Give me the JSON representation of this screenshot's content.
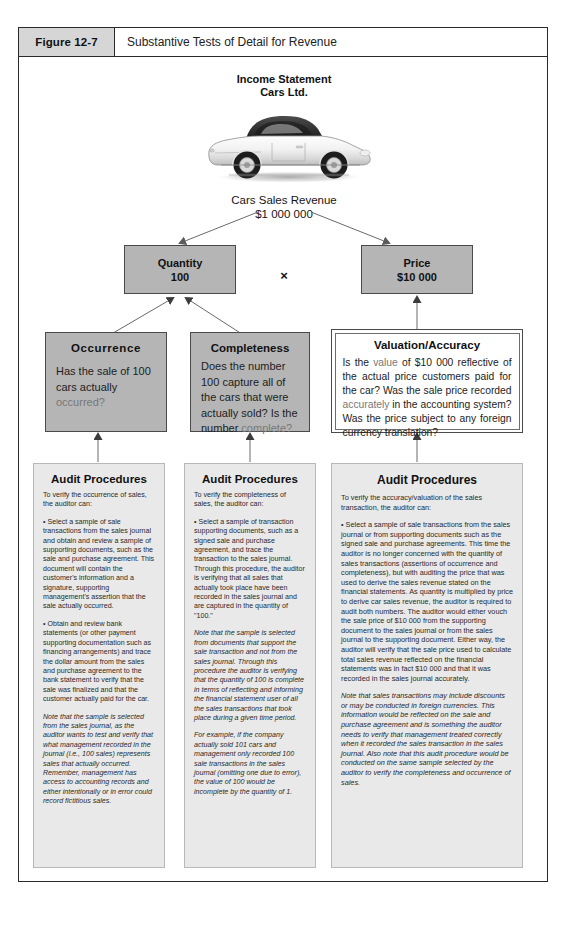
{
  "figure": {
    "number": "Figure 12-7",
    "title": "Substantive Tests of Detail for Revenue"
  },
  "statement": {
    "line1": "Income Statement",
    "line2": "Cars Ltd."
  },
  "image": {
    "alt": "white-sports-car-side-view"
  },
  "revenue": {
    "label": "Cars Sales Revenue",
    "amount": "$1 000 000"
  },
  "factors": {
    "quantity": {
      "label": "Quantity",
      "value": "100"
    },
    "operator": "×",
    "price": {
      "label": "Price",
      "value": "$10 000"
    }
  },
  "assertions": [
    {
      "id": "occurrence",
      "title": "Occurrence",
      "body_pre": "Has the sale of 100 cars actually ",
      "body_highlight": "occurred?",
      "body_post": ""
    },
    {
      "id": "completeness",
      "title": "Completeness",
      "body_pre": "Does the number 100 capture all of the cars that were actually sold? Is the number ",
      "body_highlight": "complete?",
      "body_post": ""
    },
    {
      "id": "valuation-accuracy",
      "title": "Valuation/Accuracy",
      "body_pre": "Is the ",
      "body_highlight": "value",
      "body_mid": " of $10 000 reflective of the actual price customers paid for the car? Was the sale price recorded ",
      "body_highlight2": "accurately",
      "body_post": " in the accounting system? Was the price subject to any foreign currency translation?"
    }
  ],
  "procedures": [
    {
      "id": "occurrence-procedures",
      "title": "Audit Procedures",
      "paragraphs": [
        {
          "text": "To verify the occurrence of sales, the auditor can:",
          "italic": false
        },
        {
          "text": "• Select a sample of sale transactions from the sales journal and obtain and review a sample of supporting documents, such as the sale and purchase agreement. This document will contain the customer's information and a signature, supporting management's assertion that the sale actually occurred.",
          "italic": false
        },
        {
          "text": "• Obtain and review bank statements (or other payment supporting documentation such as financing arrangements) and trace the dollar amount from the sales and purchase agreement to the bank statement to verify that the sale was finalized and that the customer actually paid for the car.",
          "italic": false
        },
        {
          "text": "Note that the sample is selected from the sales journal, as the auditor wants to test and verify that what management recorded in the journal (i.e., 100 sales) represents sales that actually occurred. Remember, management has access to accounting records and either intentionally or in error could record fictitious sales.",
          "italic": true
        }
      ]
    },
    {
      "id": "completeness-procedures",
      "title": "Audit Procedures",
      "paragraphs": [
        {
          "text": "To verify the completeness of sales, the auditor can:",
          "italic": false
        },
        {
          "text": "• Select a sample of transaction supporting documents, such as a signed sale and purchase agreement, and trace the transaction to the sales journal. Through this procedure, the auditor is verifying that all sales that actually took place have been recorded in the sales journal and are captured in the quantity of \"100.\"",
          "italic": false
        },
        {
          "text": "Note that the sample is selected from documents that support the sale transaction and not from the sales journal. Through this procedure the auditor is verifying that the quantity of 100 is complete in terms of reflecting and informing the financial statement user of all the sales transactions that took place during a given time period.",
          "italic": true
        },
        {
          "text": "For example, if the company actually sold 101 cars and management only recorded 100 sale transactions in the sales journal (omitting one due to error), the value of 100 would be incomplete by the quantity of 1.",
          "italic": true
        }
      ]
    },
    {
      "id": "valuation-procedures",
      "title": "Audit Procedures",
      "paragraphs": [
        {
          "text": "To verify the accuracy/valuation of the sales transaction, the auditor can:",
          "italic": false
        },
        {
          "text": "• Select a sample of sale transactions from the sales journal or from supporting documents such as the signed sale and purchase agreements. This time the auditor is no longer concerned with the quantity of sales transactions (assertions of occurrence and completeness), but with auditing the price that was used to derive the sales revenue stated on the financial statements. As quantity is multiplied by price to derive car sales revenue, the auditor is required to audit both numbers. The auditor would either vouch the sale price of $10 000 from the supporting document to the sales journal or from the sales journal to the supporting document. Either way, the auditor will verify that the sale price used to calculate total sales revenue reflected on the financial statements was in fact $10 000 and that it was recorded in the sales journal accurately.",
          "italic": false
        },
        {
          "text": "Note that sales transactions may include discounts or may be conducted in foreign currencies. This information would be reflected on the sale and purchase agreement and is something the auditor needs to verify that management treated correctly when it recorded the sales transaction in the sales journal. Also note that this audit procedure would be conducted on the same sample selected by the auditor to verify the completeness and occurrence of sales.",
          "italic": true
        }
      ]
    }
  ],
  "colors": {
    "frame_border": "#2a2a2a",
    "header_fill": "#d6d6d6",
    "node_grey_fill": "#b5b5b5",
    "node_light_fill": "#e9e9e9",
    "connector": "#6a6a6a",
    "highlight_text": "#787878"
  }
}
